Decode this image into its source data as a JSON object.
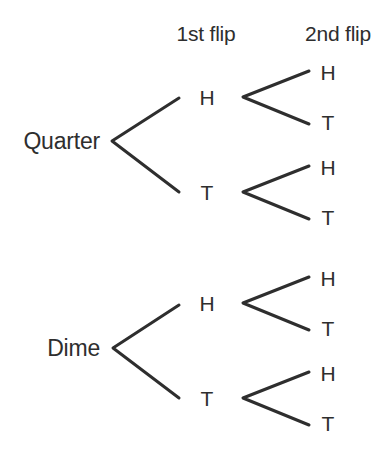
{
  "diagram": {
    "type": "tree-diagram",
    "background_color": "#ffffff",
    "line_color": "#2e2e2e",
    "text_color": "#2e2e2e",
    "line_width": 3
  },
  "headers": [
    {
      "label": "1st flip",
      "x": 206,
      "y": 33
    },
    {
      "label": "2nd flip",
      "x": 338,
      "y": 33
    }
  ],
  "roots": [
    {
      "label": "Quarter",
      "x": 100,
      "y": 141
    },
    {
      "label": "Dime",
      "x": 100,
      "y": 348
    }
  ],
  "first_flip_nodes": [
    {
      "label": "H",
      "x": 207,
      "y": 97,
      "root": "Quarter"
    },
    {
      "label": "T",
      "x": 207,
      "y": 192,
      "root": "Quarter"
    },
    {
      "label": "H",
      "x": 207,
      "y": 303,
      "root": "Dime"
    },
    {
      "label": "T",
      "x": 207,
      "y": 398,
      "root": "Dime"
    }
  ],
  "second_flip_nodes": [
    {
      "label": "H",
      "x": 328,
      "y": 72,
      "parent": "Quarter-H"
    },
    {
      "label": "T",
      "x": 328,
      "y": 122,
      "parent": "Quarter-H"
    },
    {
      "label": "H",
      "x": 328,
      "y": 167,
      "parent": "Quarter-T"
    },
    {
      "label": "T",
      "x": 328,
      "y": 217,
      "parent": "Quarter-T"
    },
    {
      "label": "H",
      "x": 328,
      "y": 278,
      "parent": "Dime-H"
    },
    {
      "label": "T",
      "x": 328,
      "y": 328,
      "parent": "Dime-H"
    },
    {
      "label": "H",
      "x": 328,
      "y": 373,
      "parent": "Dime-T"
    },
    {
      "label": "T",
      "x": 328,
      "y": 423,
      "parent": "Dime-T"
    }
  ],
  "branches": {
    "quarter_root": {
      "vx": 112,
      "vy": 141,
      "tip_x": 179,
      "up_y": 98,
      "down_y": 192
    },
    "dime_root": {
      "vx": 113,
      "vy": 348,
      "tip_x": 179,
      "up_y": 305,
      "down_y": 398
    },
    "quarter_h": {
      "vx": 243,
      "vy": 97,
      "tip_x": 309,
      "up_y": 71,
      "down_y": 124
    },
    "quarter_t": {
      "vx": 243,
      "vy": 192,
      "tip_x": 309,
      "up_y": 166,
      "down_y": 219
    },
    "dime_h": {
      "vx": 243,
      "vy": 303,
      "tip_x": 309,
      "up_y": 277,
      "down_y": 330
    },
    "dime_t": {
      "vx": 243,
      "vy": 398,
      "tip_x": 309,
      "up_y": 372,
      "down_y": 425
    }
  },
  "outcomes": [
    "Quarter-H-H",
    "Quarter-H-T",
    "Quarter-T-H",
    "Quarter-T-T",
    "Dime-H-H",
    "Dime-H-T",
    "Dime-T-H",
    "Dime-T-T"
  ]
}
